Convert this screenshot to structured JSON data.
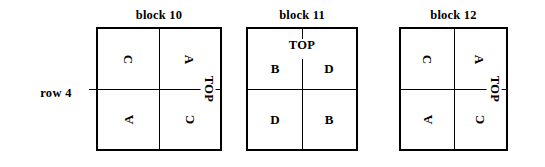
{
  "row": {
    "label": "row 4"
  },
  "blocks": [
    {
      "title": "block 10",
      "orientation": "rotated",
      "top_caption": "TOP",
      "top_caption_position": "right",
      "cells": {
        "top_left": "C",
        "top_right": "A",
        "bottom_left": "A",
        "bottom_right": "C"
      },
      "cell_rotation": {
        "top_left": "cw",
        "top_right": "cw",
        "bottom_left": "ccw",
        "bottom_right": "ccw"
      }
    },
    {
      "title": "block 11",
      "orientation": "upright",
      "top_caption": "TOP",
      "top_caption_position": "top",
      "cells": {
        "top_left": "B",
        "top_right": "D",
        "bottom_left": "D",
        "bottom_right": "B"
      },
      "cell_rotation": {
        "top_left": "none",
        "top_right": "none",
        "bottom_left": "none",
        "bottom_right": "none"
      }
    },
    {
      "title": "block 12",
      "orientation": "rotated",
      "top_caption": "TOP",
      "top_caption_position": "right",
      "cells": {
        "top_left": "C",
        "top_right": "A",
        "bottom_left": "A",
        "bottom_right": "C"
      },
      "cell_rotation": {
        "top_left": "cw",
        "top_right": "cw",
        "bottom_left": "ccw",
        "bottom_right": "ccw"
      }
    }
  ],
  "colors": {
    "ink": "#000000",
    "paper": "#ffffff"
  }
}
